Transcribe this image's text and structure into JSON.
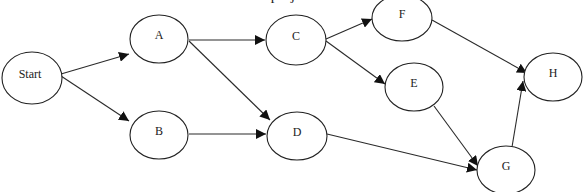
{
  "diagram": {
    "type": "directed-graph",
    "caption": "... project ...",
    "nodes": [
      {
        "id": "start",
        "label": "Start",
        "cx": 32,
        "cy": 78,
        "rx": 30,
        "ry": 26
      },
      {
        "id": "a",
        "label": "A",
        "cx": 159,
        "cy": 39,
        "rx": 29,
        "ry": 24
      },
      {
        "id": "b",
        "label": "B",
        "cx": 159,
        "cy": 135,
        "rx": 29,
        "ry": 24
      },
      {
        "id": "c",
        "label": "C",
        "cx": 296,
        "cy": 40,
        "rx": 30,
        "ry": 25
      },
      {
        "id": "d",
        "label": "D",
        "cx": 297,
        "cy": 136,
        "rx": 30,
        "ry": 24
      },
      {
        "id": "f",
        "label": "F",
        "cx": 402,
        "cy": 18,
        "rx": 30,
        "ry": 23
      },
      {
        "id": "e",
        "label": "E",
        "cx": 414,
        "cy": 87,
        "rx": 29,
        "ry": 24
      },
      {
        "id": "g",
        "label": "G",
        "cx": 506,
        "cy": 170,
        "rx": 29,
        "ry": 24
      },
      {
        "id": "h",
        "label": "H",
        "cx": 553,
        "cy": 77,
        "rx": 29,
        "ry": 24
      }
    ],
    "edges": [
      {
        "from": "start",
        "to": "a",
        "x1": 61,
        "y1": 74,
        "x2": 129,
        "y2": 54
      },
      {
        "from": "start",
        "to": "b",
        "x1": 61,
        "y1": 76,
        "x2": 129,
        "y2": 121
      },
      {
        "from": "a",
        "to": "c",
        "x1": 189,
        "y1": 40,
        "x2": 265,
        "y2": 40
      },
      {
        "from": "a",
        "to": "d",
        "x1": 189,
        "y1": 41,
        "x2": 270,
        "y2": 120
      },
      {
        "from": "b",
        "to": "d",
        "x1": 189,
        "y1": 134,
        "x2": 266,
        "y2": 134
      },
      {
        "from": "c",
        "to": "f",
        "x1": 326,
        "y1": 39,
        "x2": 372,
        "y2": 19
      },
      {
        "from": "c",
        "to": "e",
        "x1": 326,
        "y1": 41,
        "x2": 385,
        "y2": 84
      },
      {
        "from": "f",
        "to": "h",
        "x1": 432,
        "y1": 20,
        "x2": 527,
        "y2": 73
      },
      {
        "from": "e",
        "to": "g",
        "x1": 434,
        "y1": 106,
        "x2": 478,
        "y2": 166
      },
      {
        "from": "d",
        "to": "g",
        "x1": 327,
        "y1": 134,
        "x2": 477,
        "y2": 170
      },
      {
        "from": "g",
        "to": "h",
        "x1": 512,
        "y1": 147,
        "x2": 523,
        "y2": 81
      }
    ]
  }
}
